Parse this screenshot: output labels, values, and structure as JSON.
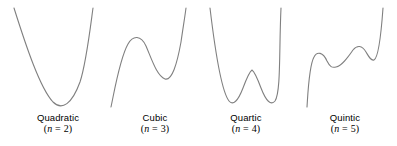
{
  "figure": {
    "title": "",
    "background_color": "#ffffff",
    "stroke_color": "#808080",
    "text_color": "#000000",
    "width": 397,
    "height": 146
  },
  "panels": [
    {
      "name": "Quadratic",
      "degree_text": "(n = 2)",
      "degree_prefix": "(",
      "degree_var": "n",
      "degree_eq": " = ",
      "degree_value": "2",
      "degree_suffix": ")"
    },
    {
      "name": "Cubic",
      "degree_text": "(n = 3)",
      "degree_prefix": "(",
      "degree_var": "n",
      "degree_eq": " = ",
      "degree_value": "3",
      "degree_suffix": ")"
    },
    {
      "name": "Quartic",
      "degree_text": "(n = 4)",
      "degree_prefix": "(",
      "degree_var": "n",
      "degree_eq": " = ",
      "degree_value": "4",
      "degree_suffix": ")"
    },
    {
      "name": "Quintic",
      "degree_text": "(n = 5)",
      "degree_prefix": "(",
      "degree_var": "n",
      "degree_eq": " = ",
      "degree_value": "5",
      "degree_suffix": ")"
    }
  ],
  "chart_data": {
    "type": "line",
    "title": "",
    "xlabel": "",
    "ylabel": "",
    "grid": false,
    "legend": "none",
    "axes_visible": false,
    "tick_labels": [],
    "note": "Four small sketch plots of polynomial curves of increasing degree; each panel is captioned with the polynomial name and its degree n.",
    "series": [
      {
        "name": "Quadratic",
        "degree": 2,
        "turning_points": 1,
        "shape": "U (upward parabola)",
        "path": "M 14 8 C 26 46, 40 88, 53 102 C 62 111, 72 104, 80 82 C 86 64, 90 30, 93 8",
        "extrema": [
          {
            "type": "minimum",
            "x": 54,
            "y": 105
          }
        ],
        "endpoints": [
          {
            "x": 14,
            "y": 8
          },
          {
            "x": 93,
            "y": 8
          }
        ]
      },
      {
        "name": "Cubic",
        "degree": 3,
        "turning_points": 2,
        "shape": "rising with one local max and one local min",
        "path": "M 111 107 C 115 88, 120 58, 128 44 C 133 35, 141 35, 146 46 C 152 60, 157 76, 165 79 C 172 81, 177 64, 181 42 C 183 28, 185 16, 186 8",
        "extrema": [
          {
            "type": "local maximum",
            "x": 136,
            "y": 38
          },
          {
            "type": "local minimum",
            "x": 166,
            "y": 80
          }
        ],
        "endpoints": [
          {
            "x": 111,
            "y": 107
          },
          {
            "x": 186,
            "y": 8
          }
        ]
      },
      {
        "name": "Quartic",
        "degree": 4,
        "turning_points": 3,
        "shape": "W (two minima separated by a local max)",
        "path": "M 210 8 C 215 50, 222 92, 229 101 C 233 106, 238 101, 243 88 C 246 80, 249 72, 252 70 C 255 72, 258 80, 261 88 C 266 101, 271 106, 275 101 C 281 92, 279 50, 281 8",
        "extrema": [
          {
            "type": "local minimum",
            "x": 232,
            "y": 104
          },
          {
            "type": "local maximum",
            "x": 252,
            "y": 70
          },
          {
            "type": "local minimum",
            "x": 272,
            "y": 104
          }
        ],
        "endpoints": [
          {
            "x": 210,
            "y": 8
          },
          {
            "x": 281,
            "y": 8
          }
        ]
      },
      {
        "name": "Quintic",
        "degree": 5,
        "turning_points": 4,
        "shape": "rising with two local maxima and two local minima",
        "path": "M 307 107 C 308 92, 309 66, 314 57 C 317 51, 323 52, 327 61 C 330 67, 332 68, 336 67 C 342 66, 348 57, 353 50 C 357 45, 362 45, 366 52 C 369 57, 371 61, 374 60 C 378 58, 381 36, 383 8",
        "extrema": [
          {
            "type": "local maximum",
            "x": 316,
            "y": 54
          },
          {
            "type": "local minimum",
            "x": 334,
            "y": 67
          },
          {
            "type": "local maximum",
            "x": 357,
            "y": 47
          },
          {
            "type": "local minimum",
            "x": 373,
            "y": 60
          }
        ],
        "endpoints": [
          {
            "x": 307,
            "y": 107
          },
          {
            "x": 383,
            "y": 8
          }
        ]
      }
    ]
  }
}
